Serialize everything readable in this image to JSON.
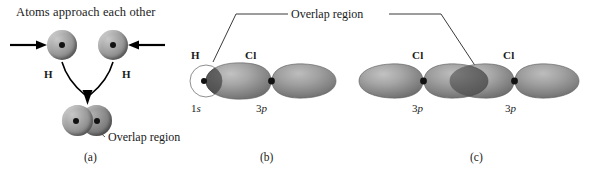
{
  "figure": {
    "type": "chemistry-orbital-overlap-diagram",
    "background_color": "#ffffff",
    "ink_color": "#1a1a1a"
  },
  "panel_a": {
    "caption": "(a)",
    "title": "Atoms approach each other",
    "atom_labels": [
      "H",
      "H"
    ],
    "overlap_label": "Overlap region",
    "arrow_left": "right-arrow",
    "arrow_right": "left-arrow",
    "merge_arrow": "down-arrow"
  },
  "panel_b": {
    "caption": "(b)",
    "atom_labels": [
      "H",
      "Cl"
    ],
    "orbital_labels": [
      "1s",
      "3p"
    ],
    "orbital_label_parts": [
      {
        "n": "1",
        "l": "s"
      },
      {
        "n": "3",
        "l": "p"
      }
    ]
  },
  "panel_c": {
    "caption": "(c)",
    "atom_labels": [
      "Cl",
      "Cl"
    ],
    "orbital_labels": [
      "3p",
      "3p"
    ],
    "orbital_label_parts": [
      {
        "n": "3",
        "l": "p"
      },
      {
        "n": "3",
        "l": "p"
      }
    ]
  },
  "shared_annotation": {
    "overlap_label": "Overlap region",
    "leader_targets": [
      "panel-b-overlap",
      "panel-c-overlap"
    ]
  },
  "colors": {
    "sphere_light": "#c8c8c8",
    "sphere_mid": "#9a9a9a",
    "sphere_dark": "#606060",
    "lobe_light": "#b9b9b9",
    "lobe_mid": "#949494",
    "lobe_dark": "#6b6b6b",
    "overlap_dark": "#545454",
    "nucleus": "#111111",
    "leader": "#3a3a3a"
  }
}
